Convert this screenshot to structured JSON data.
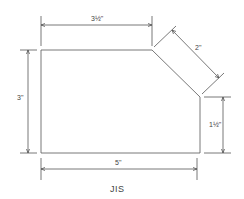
{
  "diagram": {
    "type": "dimensioned-technical-drawing",
    "shape": "pentagon (rectangle with chamfered top-right corner)",
    "dimensions": {
      "top": "3½\"",
      "left": "3\"",
      "chamfer": "2\"",
      "right": "1½\"",
      "bottom": "5\""
    },
    "caption": "JIS"
  },
  "colors": {
    "line": "#555555",
    "text": "#444444",
    "background": "#ffffff"
  }
}
